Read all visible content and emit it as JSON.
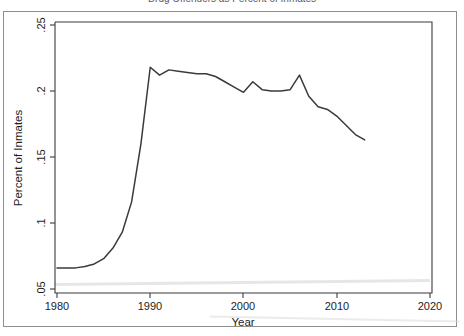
{
  "figure": {
    "clipped_title": "Drug Offenders as Percent of Inmates",
    "background_color": "#ffffff",
    "line_color": "#3a3a3a",
    "axis_color": "#3b3b3b"
  },
  "chart_data": {
    "type": "line",
    "title": "",
    "xlabel": "Year",
    "ylabel": "Percent of Inmates",
    "xlim": [
      1980,
      2020
    ],
    "ylim": [
      0.05,
      0.25
    ],
    "xticks": [
      1980,
      1990,
      2000,
      2010,
      2020
    ],
    "xtick_labels": [
      "1980",
      "1990",
      "2000",
      "2010",
      "2020"
    ],
    "yticks": [
      0.05,
      0.1,
      0.15,
      0.2,
      0.25
    ],
    "ytick_labels": [
      ".05",
      ".1",
      ".15",
      ".2",
      ".25"
    ],
    "grid": false,
    "legend": null,
    "series": [
      {
        "name": "Percent of Inmates",
        "x": [
          1980,
          1981,
          1982,
          1983,
          1984,
          1985,
          1986,
          1987,
          1988,
          1989,
          1990,
          1991,
          1992,
          1993,
          1994,
          1995,
          1996,
          1997,
          1998,
          1999,
          2000,
          2001,
          2002,
          2003,
          2004,
          2005,
          2006,
          2007,
          2008,
          2009,
          2010,
          2011,
          2012,
          2013
        ],
        "values": [
          0.066,
          0.066,
          0.066,
          0.067,
          0.069,
          0.073,
          0.081,
          0.093,
          0.116,
          0.16,
          0.218,
          0.212,
          0.216,
          0.215,
          0.214,
          0.213,
          0.213,
          0.211,
          0.207,
          0.203,
          0.199,
          0.207,
          0.201,
          0.2,
          0.2,
          0.201,
          0.212,
          0.196,
          0.188,
          0.186,
          0.181,
          0.174,
          0.167,
          0.163
        ]
      }
    ]
  },
  "axis_labels": {
    "x_title": "Year",
    "y_title": "Percent of Inmates"
  }
}
